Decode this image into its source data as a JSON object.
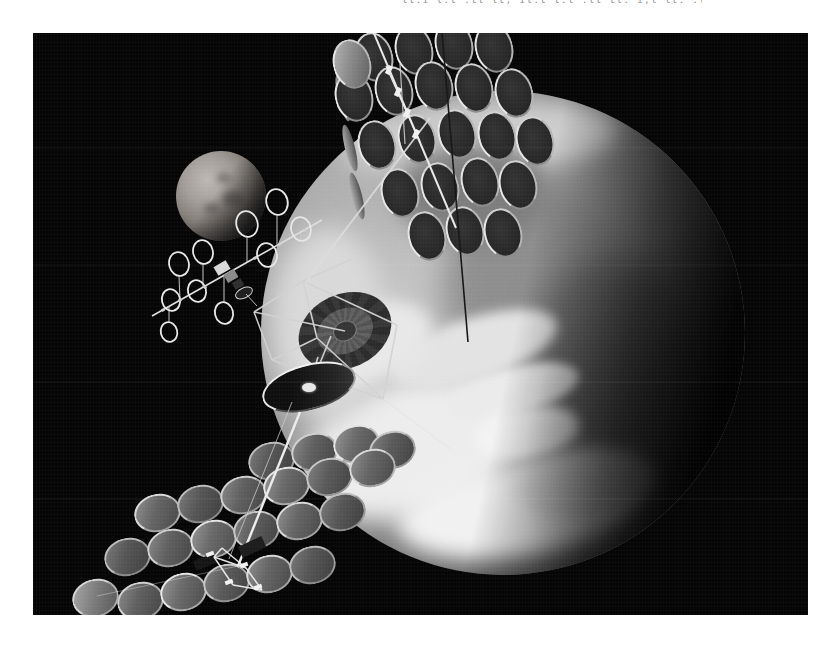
{
  "caption": {
    "text": "lt.i l:t .tl lt, il.t t:l .lt tl. i,l lt: .tl l.t tl, il. t:l lt."
  },
  "colors": {
    "page_bg": "#ffffff",
    "photo_bg": "#050505",
    "structure_light": "#e8e8e8",
    "disk_dark_face": "#2a2a2a",
    "disk_light_face": "#6e6e6e"
  },
  "scene": {
    "photo": {
      "x": 33,
      "y": 33,
      "w": 775,
      "h": 582
    },
    "earth": {
      "cx": 503,
      "cy": 333,
      "r": 242,
      "blobs": [
        {
          "l": 8,
          "t": 60,
          "w": 46,
          "h": 28,
          "c": "#ededed",
          "b": 12,
          "rot": -15
        },
        {
          "l": 28,
          "t": 77,
          "w": 50,
          "h": 19,
          "c": "#f1f1f1",
          "b": 10,
          "rot": -8
        },
        {
          "l": 2,
          "t": 28,
          "w": 24,
          "h": 40,
          "c": "#d9d9d9",
          "b": 13,
          "rot": 0
        },
        {
          "l": 16,
          "t": 2,
          "w": 58,
          "h": 16,
          "c": "#cccccc",
          "b": 11,
          "rot": -4
        },
        {
          "l": 38,
          "t": 20,
          "w": 44,
          "h": 40,
          "c": "#8e8e8e",
          "b": 15,
          "rot": 0
        },
        {
          "l": 56,
          "t": 34,
          "w": 36,
          "h": 42,
          "c": "#6e6e6e",
          "b": 16,
          "rot": 0
        },
        {
          "l": 28,
          "t": 11,
          "w": 32,
          "h": 20,
          "c": "#7d7d7d",
          "b": 12,
          "rot": 0
        },
        {
          "l": 26,
          "t": 47,
          "w": 36,
          "h": 13,
          "c": "#e3e3e3",
          "b": 6,
          "rot": -18
        },
        {
          "l": 38,
          "t": 57,
          "w": 28,
          "h": 10,
          "c": "#ebebeb",
          "b": 5,
          "rot": -14
        },
        {
          "l": 44,
          "t": 65,
          "w": 22,
          "h": 11,
          "c": "#f3f3f3",
          "b": 6,
          "rot": -10
        },
        {
          "l": 10,
          "t": 44,
          "w": 26,
          "h": 16,
          "c": "#e8e8e8",
          "b": 8,
          "rot": -20
        },
        {
          "l": 52,
          "t": 74,
          "w": 30,
          "h": 14,
          "c": "#dfdfdf",
          "b": 8,
          "rot": -6
        }
      ]
    },
    "moon": {
      "cx": 221,
      "cy": 196,
      "r": 45,
      "maria": [
        {
          "l": 52,
          "t": 44,
          "w": 24,
          "h": 18,
          "c": "#6f6b68",
          "b": 3
        },
        {
          "l": 30,
          "t": 58,
          "w": 18,
          "h": 12,
          "c": "#767270",
          "b": 3
        },
        {
          "l": 46,
          "t": 24,
          "w": 16,
          "h": 12,
          "c": "#7c7875",
          "b": 3
        }
      ]
    },
    "top_array": {
      "disks": [
        [
          374,
          57
        ],
        [
          414,
          50
        ],
        [
          454,
          45
        ],
        [
          494,
          48
        ],
        [
          354,
          97
        ],
        [
          394,
          91
        ],
        [
          434,
          86
        ],
        [
          474,
          88
        ],
        [
          514,
          93
        ],
        [
          377,
          145
        ],
        [
          417,
          139
        ],
        [
          457,
          134
        ],
        [
          497,
          136
        ],
        [
          535,
          141
        ],
        [
          400,
          193
        ],
        [
          440,
          187
        ],
        [
          480,
          182
        ],
        [
          518,
          185
        ],
        [
          427,
          236
        ],
        [
          465,
          231
        ],
        [
          503,
          233
        ]
      ],
      "light_disks": [
        [
          352,
          64
        ]
      ],
      "slivers": [
        [
          343,
          98
        ],
        [
          350,
          148
        ],
        [
          357,
          196
        ]
      ]
    },
    "bottom_array": {
      "disks": [
        [
          271,
          461
        ],
        [
          314,
          452
        ],
        [
          356,
          444
        ],
        [
          392,
          450
        ],
        [
          157,
          513
        ],
        [
          200,
          504
        ],
        [
          243,
          495
        ],
        [
          286,
          486
        ],
        [
          329,
          477
        ],
        [
          372,
          468
        ],
        [
          127,
          557
        ],
        [
          170,
          548
        ],
        [
          213,
          539
        ],
        [
          256,
          530
        ],
        [
          299,
          521
        ],
        [
          342,
          512
        ],
        [
          140,
          601
        ],
        [
          183,
          592
        ],
        [
          226,
          583
        ],
        [
          269,
          574
        ],
        [
          312,
          565
        ]
      ],
      "dim_disks": [
        [
          95,
          598
        ]
      ]
    },
    "ring_satellite": {
      "boom": [
        152,
        316,
        322,
        220
      ],
      "rings": [
        {
          "c": [
            179,
            264
          ],
          "r": 12
        },
        {
          "c": [
            203,
            252
          ],
          "r": 12
        },
        {
          "c": [
            247,
            224
          ],
          "r": 13
        },
        {
          "c": [
            277,
            202
          ],
          "r": 13
        },
        {
          "c": [
            301,
            229
          ],
          "r": 12
        },
        {
          "c": [
            171,
            300
          ],
          "r": 11
        },
        {
          "c": [
            197,
            291
          ],
          "r": 11
        },
        {
          "c": [
            169,
            332
          ],
          "r": 10
        },
        {
          "c": [
            224,
            313
          ],
          "r": 11
        },
        {
          "c": [
            267,
            255
          ],
          "r": 12
        }
      ],
      "stems": [
        [
          179,
          276,
          180,
          300
        ],
        [
          203,
          264,
          203,
          287
        ],
        [
          247,
          237,
          247,
          262
        ],
        [
          277,
          215,
          277,
          245
        ],
        [
          169,
          322,
          169,
          306
        ],
        [
          224,
          302,
          224,
          276
        ],
        [
          301,
          241,
          301,
          233
        ]
      ],
      "dots": [
        [
          180,
          300
        ],
        [
          205,
          287
        ],
        [
          230,
          273
        ],
        [
          255,
          258
        ],
        [
          280,
          244
        ],
        [
          305,
          230
        ],
        [
          163,
          310
        ]
      ],
      "hub_rects": [
        {
          "x": 222,
          "y": 268,
          "w": 14,
          "h": 10,
          "rot": -30,
          "fill": "#d8d8d8"
        },
        {
          "x": 231,
          "y": 276,
          "w": 12,
          "h": 9,
          "rot": -30,
          "fill": "#8a8a8a"
        },
        {
          "x": 238,
          "y": 284,
          "w": 10,
          "h": 8,
          "rot": -30,
          "fill": "#2e2e2e"
        }
      ],
      "hub_dish": {
        "c": [
          244,
          293
        ],
        "rx": 9,
        "ry": 5,
        "rot": -25
      },
      "hub_stub": [
        246,
        294,
        257,
        306
      ]
    },
    "central_station": {
      "radial_disk": {
        "cx": 345,
        "cy": 331,
        "rx": 48,
        "ry": 37
      },
      "dish": {
        "cx": 309,
        "cy": 387,
        "rx": 48,
        "ry": 23
      },
      "dish_hub": {
        "cx": 309,
        "cy": 387,
        "rx": 7,
        "ry": 4.5
      },
      "truss": [
        [
          303,
          281,
          254,
          312
        ],
        [
          254,
          312,
          272,
          360
        ],
        [
          303,
          281,
          397,
          325
        ],
        [
          397,
          325,
          383,
          399
        ],
        [
          303,
          281,
          317,
          338
        ],
        [
          317,
          338,
          272,
          360
        ],
        [
          272,
          360,
          383,
          399
        ],
        [
          317,
          338,
          383,
          399
        ],
        [
          303,
          281,
          352,
          259
        ],
        [
          254,
          312,
          345,
          331
        ],
        [
          309,
          387,
          318,
          357
        ],
        [
          331,
          336,
          300,
          412
        ]
      ],
      "wires": [
        [
          383,
          399,
          452,
          450
        ]
      ]
    },
    "lines": [
      {
        "p": [
          373,
          31,
          456,
          228
        ],
        "c": "#e8e8e8",
        "w": 2,
        "o": 1
      },
      {
        "p": [
          430,
          118,
          306,
          282
        ],
        "c": "#dcdcdc",
        "w": 1.8,
        "o": 0.9
      },
      {
        "p": [
          442,
          32,
          468,
          342
        ],
        "c": "#161616",
        "w": 1.6,
        "o": 1
      },
      {
        "p": [
          300,
          412,
          238,
          566
        ],
        "c": "#ececec",
        "w": 2.4,
        "o": 1
      },
      {
        "p": [
          292,
          402,
          229,
          559
        ],
        "c": "#cfcfcf",
        "w": 1,
        "o": 0.75
      },
      {
        "p": [
          238,
          566,
          97,
          596
        ],
        "c": "#ffffff",
        "w": 0.8,
        "o": 0.4
      },
      {
        "p": [
          386,
          66,
          420,
          142
        ],
        "c": "#f0f0f0",
        "w": 1.4,
        "o": 0.95
      },
      {
        "p": [
          400,
          64,
          405,
          144
        ],
        "c": "#d8d8d8",
        "w": 1.2,
        "o": 0.8
      }
    ],
    "top_hub_rects": [
      [
        389,
        70
      ],
      [
        398,
        92
      ],
      [
        407,
        113
      ],
      [
        416,
        134
      ]
    ],
    "bottom_hub": {
      "segments": [
        [
          214,
          557,
          246,
          568
        ],
        [
          246,
          568,
          262,
          590
        ],
        [
          214,
          557,
          233,
          585
        ],
        [
          233,
          585,
          262,
          590
        ],
        [
          222,
          548,
          246,
          568
        ],
        [
          214,
          557,
          222,
          548
        ]
      ],
      "rects": [
        [
          210,
          554
        ],
        [
          244,
          565
        ],
        [
          229,
          582
        ],
        [
          258,
          587
        ]
      ],
      "dark_quads": [
        {
          "x": 205,
          "y": 562,
          "w": 22,
          "h": 10,
          "rot": -20,
          "fill": "#151515"
        },
        {
          "x": 252,
          "y": 547,
          "w": 26,
          "h": 12,
          "rot": -25,
          "fill": "#1c1c1c"
        }
      ]
    }
  }
}
